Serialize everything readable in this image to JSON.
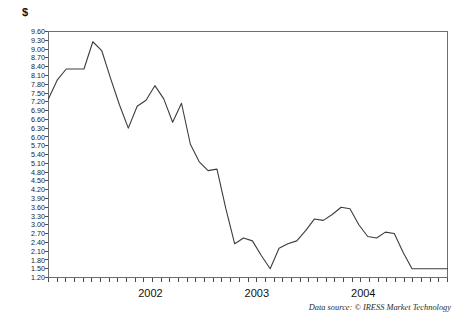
{
  "chart_data": {
    "type": "line",
    "title": "",
    "subtitle": "",
    "ylabel": "$",
    "xlabel": "",
    "grid": false,
    "legend": false,
    "legend_position": "none",
    "source_note": "Data source: © IRESS Market Technology",
    "ylim": [
      1.2,
      9.6
    ],
    "ytick_labels": [
      "9.60",
      "9.30",
      "9.00",
      "8.70",
      "8.40",
      "8.10",
      "7.80",
      "7.50",
      "7.20",
      "6.90",
      "6.60",
      "6.30",
      "6.00",
      "5.70",
      "5.40",
      "5.10",
      "4.80",
      "4.50",
      "4.20",
      "3.90",
      "3.60",
      "3.30",
      "3.00",
      "2.70",
      "2.40",
      "2.10",
      "1.80",
      "1.50",
      "1.20"
    ],
    "ytick_values": [
      9.6,
      9.3,
      9.0,
      8.7,
      8.4,
      8.1,
      7.8,
      7.5,
      7.2,
      6.9,
      6.6,
      6.3,
      6.0,
      5.7,
      5.4,
      5.1,
      4.8,
      4.5,
      4.2,
      3.9,
      3.6,
      3.3,
      3.0,
      2.7,
      2.4,
      2.1,
      1.8,
      1.5,
      1.2
    ],
    "xtick_labels": [
      "2002",
      "2003",
      "2004"
    ],
    "xtick_positions": [
      11.5,
      23.5,
      35.5
    ],
    "xlim": [
      0,
      45
    ],
    "n_points": 46,
    "x": [
      0,
      1,
      2,
      3,
      4,
      5,
      6,
      7,
      8,
      9,
      10,
      11,
      12,
      13,
      14,
      15,
      16,
      17,
      18,
      19,
      20,
      21,
      22,
      23,
      24,
      25,
      26,
      27,
      28,
      29,
      30,
      31,
      32,
      33,
      34,
      35,
      36,
      37,
      38,
      39,
      40,
      41,
      42,
      43,
      44,
      45
    ],
    "values": [
      7.3,
      7.95,
      8.32,
      8.32,
      8.32,
      9.25,
      8.95,
      8.0,
      7.1,
      6.3,
      7.05,
      7.25,
      7.75,
      7.3,
      6.5,
      7.15,
      5.75,
      5.15,
      4.85,
      4.9,
      3.55,
      2.35,
      2.55,
      2.45,
      1.95,
      1.5,
      2.2,
      2.35,
      2.45,
      2.8,
      3.2,
      3.15,
      3.35,
      3.6,
      3.55,
      3.0,
      2.6,
      2.55,
      2.75,
      2.7,
      2.05,
      1.5,
      1.5,
      1.5,
      1.5,
      1.5
    ],
    "series": [
      {
        "name": "share-price",
        "color": "#3c3c3c",
        "values": [
          7.3,
          7.95,
          8.32,
          8.32,
          8.32,
          9.25,
          8.95,
          8.0,
          7.1,
          6.3,
          7.05,
          7.25,
          7.75,
          7.3,
          6.5,
          7.15,
          5.75,
          5.15,
          4.85,
          4.9,
          3.55,
          2.35,
          2.55,
          2.45,
          1.95,
          1.5,
          2.2,
          2.35,
          2.45,
          2.8,
          3.2,
          3.15,
          3.35,
          3.6,
          3.55,
          3.0,
          2.6,
          2.55,
          2.75,
          2.7,
          2.05,
          1.5,
          1.5,
          1.5,
          1.5,
          1.5
        ]
      }
    ],
    "n_xticks": 46,
    "colors": {
      "line": "#3c3c3c",
      "axis": "#6e6e6e",
      "tick": "#4d4d4d",
      "text": "#1a1a1a",
      "background": "#ffffff"
    }
  }
}
